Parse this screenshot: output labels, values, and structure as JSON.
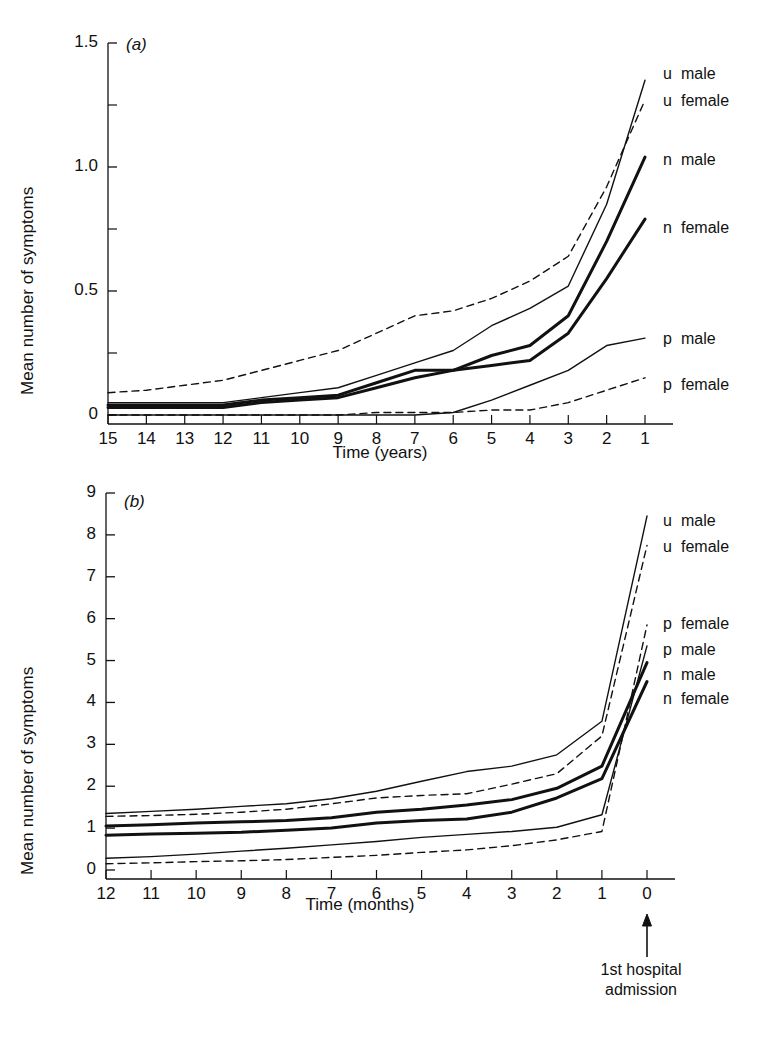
{
  "figure": {
    "background": "#ffffff",
    "ink": "#111111"
  },
  "panel_a": {
    "tag": "(a)",
    "ylabel": "Mean number of symptoms",
    "xlabel": "Time (years)",
    "yticks": [
      "0",
      "0.5",
      "1.0",
      "1.5"
    ],
    "xticks": [
      "15",
      "14",
      "13",
      "12",
      "11",
      "10",
      "9",
      "8",
      "7",
      "6",
      "5",
      "4",
      "3",
      "2",
      "1"
    ],
    "legend": [
      {
        "code": "u",
        "sex": "male"
      },
      {
        "code": "u",
        "sex": "female"
      },
      {
        "code": "n",
        "sex": "male"
      },
      {
        "code": "n",
        "sex": "female"
      },
      {
        "code": "p",
        "sex": "male"
      },
      {
        "code": "p",
        "sex": "female"
      }
    ]
  },
  "panel_b": {
    "tag": "(b)",
    "ylabel": "Mean number of symptoms",
    "xlabel": "Time (months)",
    "yticks": [
      "0",
      "1",
      "2",
      "3",
      "4",
      "5",
      "6",
      "7",
      "8",
      "9"
    ],
    "xticks": [
      "12",
      "11",
      "10",
      "9",
      "8",
      "7",
      "6",
      "5",
      "4",
      "3",
      "2",
      "1",
      "0"
    ],
    "legend": [
      {
        "code": "u",
        "sex": "male"
      },
      {
        "code": "u",
        "sex": "female"
      },
      {
        "code": "p",
        "sex": "female"
      },
      {
        "code": "p",
        "sex": "male"
      },
      {
        "code": "n",
        "sex": "male"
      },
      {
        "code": "n",
        "sex": "female"
      }
    ],
    "annotation": {
      "line1": "1st hospital",
      "line2": "admission",
      "arrow": "up-arrow-icon"
    }
  },
  "chart_data": [
    {
      "id": "panel-a",
      "type": "line",
      "title": "(a)",
      "xlabel": "Time (years)",
      "ylabel": "Mean number of symptoms",
      "x": [
        15,
        14,
        13,
        12,
        11,
        10,
        9,
        8,
        7,
        6,
        5,
        4,
        3,
        2,
        1
      ],
      "xlim": [
        15,
        1
      ],
      "ylim": [
        0,
        1.5
      ],
      "yticks": [
        0,
        0.5,
        1.0,
        1.5
      ],
      "grid": false,
      "legend_position": "right-outside",
      "series": [
        {
          "name": "u male",
          "code": "u",
          "sex": "male",
          "style": "thin-solid",
          "values": [
            0.05,
            0.05,
            0.05,
            0.05,
            0.07,
            0.09,
            0.11,
            0.16,
            0.21,
            0.26,
            0.36,
            0.43,
            0.52,
            0.85,
            1.35
          ]
        },
        {
          "name": "u female",
          "code": "u",
          "sex": "female",
          "style": "dashed",
          "values": [
            0.09,
            0.1,
            0.12,
            0.14,
            0.18,
            0.22,
            0.26,
            0.33,
            0.4,
            0.42,
            0.47,
            0.54,
            0.64,
            0.92,
            1.27
          ]
        },
        {
          "name": "n male",
          "code": "n",
          "sex": "male",
          "style": "thick-solid",
          "values": [
            0.04,
            0.04,
            0.04,
            0.04,
            0.06,
            0.07,
            0.08,
            0.13,
            0.18,
            0.18,
            0.24,
            0.28,
            0.4,
            0.7,
            1.04
          ]
        },
        {
          "name": "n female",
          "code": "n",
          "sex": "female",
          "style": "thick-solid",
          "values": [
            0.03,
            0.03,
            0.03,
            0.03,
            0.05,
            0.06,
            0.07,
            0.11,
            0.15,
            0.18,
            0.2,
            0.22,
            0.33,
            0.55,
            0.79
          ]
        },
        {
          "name": "p male",
          "code": "p",
          "sex": "male",
          "style": "thin-solid",
          "values": [
            0.0,
            0.0,
            0.0,
            0.0,
            0.0,
            0.0,
            0.0,
            0.0,
            0.0,
            0.01,
            0.06,
            0.12,
            0.18,
            0.28,
            0.31
          ]
        },
        {
          "name": "p female",
          "code": "p",
          "sex": "female",
          "style": "dashed",
          "values": [
            0.0,
            0.0,
            0.0,
            0.0,
            0.0,
            0.0,
            0.0,
            0.01,
            0.01,
            0.01,
            0.02,
            0.02,
            0.05,
            0.1,
            0.15
          ]
        }
      ]
    },
    {
      "id": "panel-b",
      "type": "line",
      "title": "(b)",
      "xlabel": "Time (months)",
      "ylabel": "Mean number of symptoms",
      "x": [
        12,
        11,
        10,
        9,
        8,
        7,
        6,
        5,
        4,
        3,
        2,
        1,
        0
      ],
      "xlim": [
        12,
        0
      ],
      "ylim": [
        0,
        9
      ],
      "yticks": [
        0,
        1,
        2,
        3,
        4,
        5,
        6,
        7,
        8,
        9
      ],
      "grid": false,
      "legend_position": "right-outside",
      "annotation": "1st hospital admission at month 0",
      "series": [
        {
          "name": "u male",
          "code": "u",
          "sex": "male",
          "style": "thin-solid",
          "values": [
            1.35,
            1.4,
            1.45,
            1.52,
            1.58,
            1.7,
            1.88,
            2.12,
            2.35,
            2.48,
            2.75,
            3.55,
            8.45
          ]
        },
        {
          "name": "u female",
          "code": "u",
          "sex": "female",
          "style": "dashed",
          "values": [
            1.28,
            1.3,
            1.33,
            1.38,
            1.45,
            1.58,
            1.72,
            1.78,
            1.82,
            2.05,
            2.3,
            3.2,
            7.75
          ]
        },
        {
          "name": "p female",
          "code": "p",
          "sex": "female",
          "style": "dashed",
          "values": [
            0.15,
            0.17,
            0.2,
            0.22,
            0.25,
            0.3,
            0.35,
            0.42,
            0.48,
            0.58,
            0.72,
            0.92,
            5.85
          ]
        },
        {
          "name": "p male",
          "code": "p",
          "sex": "male",
          "style": "thin-solid",
          "values": [
            0.28,
            0.32,
            0.38,
            0.45,
            0.52,
            0.6,
            0.68,
            0.78,
            0.85,
            0.92,
            1.02,
            1.32,
            5.35
          ]
        },
        {
          "name": "n male",
          "code": "n",
          "sex": "male",
          "style": "thick-solid",
          "values": [
            1.05,
            1.08,
            1.12,
            1.15,
            1.18,
            1.25,
            1.38,
            1.45,
            1.55,
            1.68,
            1.95,
            2.48,
            4.95
          ]
        },
        {
          "name": "n female",
          "code": "n",
          "sex": "female",
          "style": "thick-solid",
          "values": [
            0.83,
            0.86,
            0.88,
            0.9,
            0.95,
            1.0,
            1.12,
            1.18,
            1.22,
            1.38,
            1.72,
            2.18,
            4.5
          ]
        }
      ]
    }
  ]
}
